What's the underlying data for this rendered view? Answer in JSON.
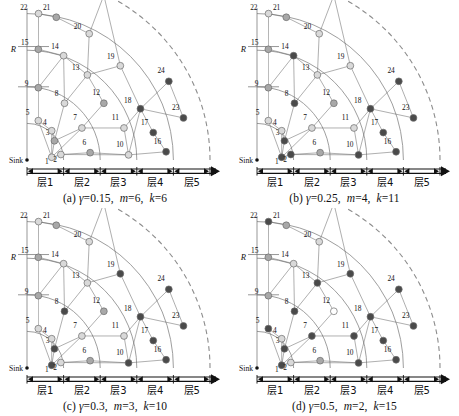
{
  "figure": {
    "type": "multi-panel-diagram",
    "title_visible": false,
    "panel_count": 4,
    "layer_labels": [
      "层1",
      "层2",
      "层3",
      "层4",
      "层5"
    ],
    "radius_label": "R",
    "sink_label": "Sink",
    "node_count": 25,
    "node_ids": [
      1,
      2,
      3,
      4,
      5,
      6,
      7,
      8,
      9,
      10,
      11,
      12,
      13,
      14,
      15,
      16,
      17,
      18,
      19,
      20,
      21,
      22,
      23,
      24,
      25
    ],
    "colors": {
      "node_light": "#d9d9d9",
      "node_mid": "#a8a8a8",
      "node_dark": "#4a4a4a",
      "node_white": "#ffffff",
      "stroke": "#6b6b6b",
      "arc": "#8c8c8c",
      "axis": "#111111",
      "background": "#ffffff"
    }
  },
  "panels": [
    {
      "id": "a",
      "caption_index": "(a)",
      "gamma_symbol": "γ",
      "gamma_value": "0.15",
      "m_symbol": "m",
      "m_value": "6",
      "k_symbol": "k",
      "k_value": "6",
      "caption_full": "(a) γ=0.15, m=6, k=6",
      "dark_nodes": [
        24,
        18,
        17,
        16,
        23
      ]
    },
    {
      "id": "b",
      "caption_index": "(b)",
      "gamma_symbol": "γ",
      "gamma_value": "0.25",
      "m_symbol": "m",
      "m_value": "4",
      "k_symbol": "k",
      "k_value": "11",
      "caption_full": "(b) γ=0.25, m=4, k=11",
      "dark_nodes": [
        14,
        8,
        24,
        18,
        17,
        23,
        16,
        10,
        3,
        2,
        1
      ]
    },
    {
      "id": "c",
      "caption_index": "(c)",
      "gamma_symbol": "γ",
      "gamma_value": "0.3",
      "m_symbol": "m",
      "m_value": "3",
      "k_symbol": "k",
      "k_value": "10",
      "caption_full": "(c) γ=0.3, m=3, k=10",
      "dark_nodes": [
        19,
        24,
        18,
        17,
        23,
        16,
        10,
        8,
        3,
        1
      ]
    },
    {
      "id": "d",
      "caption_index": "(d)",
      "gamma_symbol": "γ",
      "gamma_value": "0.5",
      "m_symbol": "m",
      "m_value": "2",
      "k_symbol": "k",
      "k_value": "15",
      "caption_full": "(d) γ=0.5, m=2, k=15",
      "dark_nodes": [
        22,
        19,
        13,
        24,
        18,
        23,
        17,
        16,
        10,
        11,
        8,
        5,
        3,
        1,
        7
      ],
      "white_nodes": [
        12
      ]
    }
  ],
  "chart_data": {
    "type": "scatter",
    "title": "",
    "xlabel": "",
    "ylabel": "",
    "layer_boundaries_r": [
      0.2,
      0.4,
      0.6,
      0.8,
      1.0
    ],
    "nodes": [
      {
        "id": 1,
        "x": 0.135,
        "y": 0.015,
        "lx": -1,
        "ly": 9
      },
      {
        "id": 2,
        "x": 0.185,
        "y": 0.03,
        "lx": -2,
        "ly": 9
      },
      {
        "id": 3,
        "x": 0.15,
        "y": 0.105,
        "lx": -3,
        "ly": -4
      },
      {
        "id": 4,
        "x": 0.135,
        "y": 0.16,
        "lx": -3,
        "ly": -4
      },
      {
        "id": 5,
        "x": 0.062,
        "y": 0.215,
        "lx": -7,
        "ly": -4
      },
      {
        "id": 6,
        "x": 0.345,
        "y": 0.04,
        "lx": -2,
        "ly": -6
      },
      {
        "id": 7,
        "x": 0.3,
        "y": 0.175,
        "lx": -3,
        "ly": -6
      },
      {
        "id": 8,
        "x": 0.205,
        "y": 0.31,
        "lx": -4,
        "ly": -5
      },
      {
        "id": 9,
        "x": 0.062,
        "y": 0.395,
        "lx": -8,
        "ly": 0
      },
      {
        "id": 10,
        "x": 0.555,
        "y": 0.028,
        "lx": -3,
        "ly": -6
      },
      {
        "id": 11,
        "x": 0.53,
        "y": 0.175,
        "lx": -3,
        "ly": -6
      },
      {
        "id": 12,
        "x": 0.42,
        "y": 0.31,
        "lx": -2,
        "ly": -6
      },
      {
        "id": 13,
        "x": 0.33,
        "y": 0.465,
        "lx": -6,
        "ly": -3
      },
      {
        "id": 14,
        "x": 0.2,
        "y": 0.57,
        "lx": -3,
        "ly": -5
      },
      {
        "id": 15,
        "x": 0.062,
        "y": 0.605,
        "lx": -8,
        "ly": -2
      },
      {
        "id": 16,
        "x": 0.76,
        "y": 0.045,
        "lx": -3,
        "ly": -6
      },
      {
        "id": 17,
        "x": 0.69,
        "y": 0.15,
        "lx": -3,
        "ly": -6
      },
      {
        "id": 18,
        "x": 0.62,
        "y": 0.28,
        "lx": -7,
        "ly": -4
      },
      {
        "id": 19,
        "x": 0.51,
        "y": 0.515,
        "lx": -4,
        "ly": -5
      },
      {
        "id": 20,
        "x": 0.34,
        "y": 0.69,
        "lx": -6,
        "ly": -3
      },
      {
        "id": 21,
        "x": 0.16,
        "y": 0.78,
        "lx": -4,
        "ly": -5
      },
      {
        "id": 22,
        "x": 0.063,
        "y": 0.8,
        "lx": -9,
        "ly": -2
      },
      {
        "id": 23,
        "x": 0.855,
        "y": 0.23,
        "lx": -2,
        "ly": -6
      },
      {
        "id": 24,
        "x": 0.775,
        "y": 0.43,
        "lx": -2,
        "ly": -6
      },
      {
        "id": 25,
        "x": 0.42,
        "y": 0.9,
        "lx": -4,
        "ly": -5
      }
    ],
    "edges": [
      [
        1,
        2
      ],
      [
        1,
        3
      ],
      [
        1,
        4
      ],
      [
        1,
        5
      ],
      [
        2,
        6
      ],
      [
        3,
        4
      ],
      [
        3,
        7
      ],
      [
        3,
        8
      ],
      [
        1,
        7
      ],
      [
        7,
        11
      ],
      [
        7,
        12
      ],
      [
        8,
        13
      ],
      [
        8,
        14
      ],
      [
        5,
        9
      ],
      [
        9,
        15
      ],
      [
        14,
        15
      ],
      [
        13,
        14
      ],
      [
        13,
        20
      ],
      [
        13,
        19
      ],
      [
        20,
        21
      ],
      [
        21,
        22
      ],
      [
        20,
        25
      ],
      [
        19,
        25
      ],
      [
        18,
        19
      ],
      [
        10,
        18
      ],
      [
        10,
        11
      ],
      [
        17,
        18
      ],
      [
        18,
        23
      ],
      [
        18,
        24
      ],
      [
        16,
        17
      ],
      [
        10,
        16
      ],
      [
        6,
        10
      ],
      [
        2,
        10
      ],
      [
        15,
        22
      ],
      [
        9,
        14
      ],
      [
        12,
        13
      ],
      [
        11,
        18
      ],
      [
        5,
        4
      ],
      [
        23,
        24
      ]
    ]
  }
}
